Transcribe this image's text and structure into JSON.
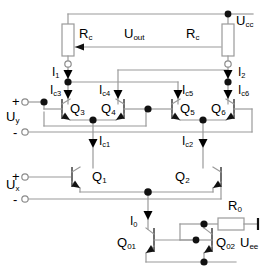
{
  "diagram": {
    "type": "analog-circuit-schematic",
    "stroke_color": "#999999",
    "symbol_color": "#000000",
    "background": "#ffffff",
    "labels": {
      "supply_positive": "U",
      "supply_positive_sub": "cc",
      "supply_negative": "U",
      "supply_negative_sub": "ee",
      "output": "U",
      "output_sub": "out",
      "input_y": "U",
      "input_y_sub": "y",
      "input_x": "U",
      "input_x_sub": "x",
      "resistor_left": "R",
      "resistor_left_sub": "c",
      "resistor_right": "R",
      "resistor_right_sub": "c",
      "resistor_bias": "R",
      "resistor_bias_sub": "0",
      "current_1": "I",
      "current_1_sub": "1",
      "current_2": "I",
      "current_2_sub": "2",
      "current_c1": "I",
      "current_c1_sub": "c1",
      "current_c2": "I",
      "current_c2_sub": "c2",
      "current_c3": "I",
      "current_c3_sub": "c3",
      "current_c4": "I",
      "current_c4_sub": "c4",
      "current_c5": "I",
      "current_c5_sub": "c5",
      "current_c6": "I",
      "current_c6_sub": "c6",
      "current_0": "I",
      "current_0_sub": "0",
      "transistor_q1": "Q",
      "transistor_q1_sub": "1",
      "transistor_q2": "Q",
      "transistor_q2_sub": "2",
      "transistor_q3": "Q",
      "transistor_q3_sub": "3",
      "transistor_q4": "Q",
      "transistor_q4_sub": "4",
      "transistor_q5": "Q",
      "transistor_q5_sub": "5",
      "transistor_q6": "Q",
      "transistor_q6_sub": "6",
      "transistor_q01": "Q",
      "transistor_q01_sub": "01",
      "transistor_q02": "Q",
      "transistor_q02_sub": "02",
      "plus_y": "+",
      "minus_y": "-",
      "plus_x": "+",
      "minus_x": "-"
    }
  }
}
